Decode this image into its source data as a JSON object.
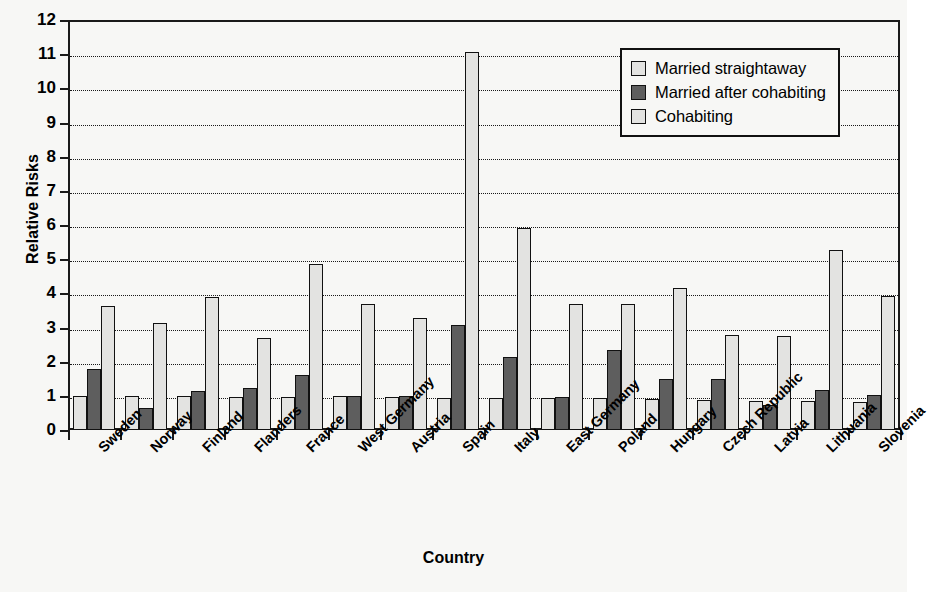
{
  "chart_data": {
    "type": "bar",
    "title": "",
    "xlabel": "Country",
    "ylabel": "Relative Risks",
    "ylim": [
      0,
      12
    ],
    "ytick_step": 1,
    "ytick_labels": [
      "0",
      "1",
      "2",
      "3",
      "4",
      "5",
      "6",
      "7",
      "8",
      "9",
      "10",
      "11",
      "12"
    ],
    "grid": true,
    "grid_style": "dotted-horizontal",
    "legend_position": "top-right-inside",
    "categories": [
      "Sweden",
      "Norway",
      "Finland",
      "Flanders",
      "France",
      "West Germany",
      "Austria",
      "Spain",
      "Italy",
      "East Germany",
      "Poland",
      "Hungary",
      "Czech Republic",
      "Latvia",
      "Lithuania",
      "Slovenia"
    ],
    "series": [
      {
        "name": "Married straightaway",
        "color": "#e3e3e1",
        "values": [
          1.0,
          1.0,
          1.0,
          0.98,
          0.98,
          1.0,
          0.98,
          0.95,
          0.95,
          0.95,
          0.93,
          0.9,
          0.88,
          0.85,
          0.85,
          0.83
        ]
      },
      {
        "name": "Married after cohabiting",
        "color": "#5e5e5e",
        "values": [
          1.78,
          0.63,
          1.13,
          1.24,
          1.6,
          1.0,
          1.0,
          3.08,
          2.15,
          0.98,
          2.33,
          1.5,
          1.5,
          0.72,
          1.18,
          1.03
        ]
      },
      {
        "name": "Cohabiting",
        "color": "#e3e3e1",
        "values": [
          3.63,
          3.12,
          3.88,
          2.7,
          4.85,
          3.68,
          3.27,
          11.05,
          5.9,
          3.68,
          3.7,
          4.17,
          2.78,
          2.75,
          5.28,
          3.93
        ]
      }
    ]
  },
  "legend": {
    "items": [
      {
        "label": "Married straightaway"
      },
      {
        "label": "Married after cohabiting"
      },
      {
        "label": "Cohabiting"
      }
    ]
  },
  "axes": {
    "y_title": "Relative Risks",
    "x_title": "Country"
  }
}
